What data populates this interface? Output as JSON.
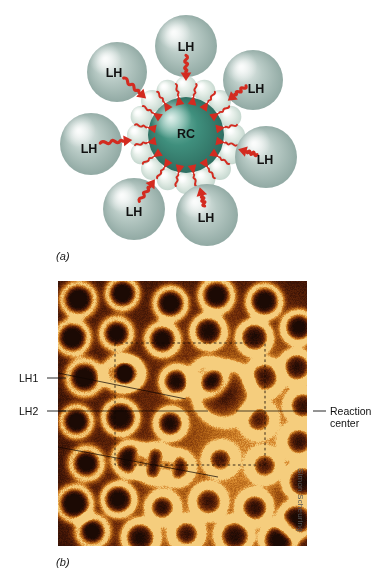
{
  "figure": {
    "panels": [
      {
        "letter": "(a)",
        "type": "schematic"
      },
      {
        "letter": "(b)",
        "type": "afm-micrograph"
      }
    ],
    "credit": "Simon Scheuring"
  },
  "panel_a": {
    "letter": "(a)",
    "core_label": "RC",
    "lh_label": "LH",
    "lh_count": 7,
    "lh_spheres": [
      {
        "label": "LH",
        "cx": 186,
        "cy": 46,
        "r": 31,
        "label_x": 186,
        "label_y": 48
      },
      {
        "label": "LH",
        "cx": 117,
        "cy": 72,
        "r": 30,
        "label_x": 114,
        "label_y": 74
      },
      {
        "label": "LH",
        "cx": 253,
        "cy": 80,
        "r": 30,
        "label_x": 256,
        "label_y": 90
      },
      {
        "label": "LH",
        "cx": 91,
        "cy": 144,
        "r": 31,
        "label_x": 89,
        "label_y": 150
      },
      {
        "label": "LH",
        "cx": 266,
        "cy": 157,
        "r": 31,
        "label_x": 265,
        "label_y": 161
      },
      {
        "label": "LH",
        "cx": 134,
        "cy": 209,
        "r": 31,
        "label_x": 134,
        "label_y": 213
      },
      {
        "label": "LH",
        "cx": 207,
        "cy": 215,
        "r": 31,
        "label_x": 206,
        "label_y": 219
      }
    ],
    "core": {
      "cx": 186,
      "cy": 135,
      "r": 38
    },
    "ring_bead_count": 16,
    "ring_radius": 48,
    "ring_bead_radius": 11,
    "colors": {
      "lh_sphere_light": "#eef3f1",
      "lh_sphere_mid": "#b9cbc6",
      "lh_sphere_dark": "#8ea7a1",
      "core_light": "#7fbfae",
      "core_mid": "#3f8f7d",
      "core_dark": "#2d6b5e",
      "ring_bead_light": "#ffffff",
      "ring_bead_mid": "#e6efe9",
      "ring_bead_dark": "#c3d6cd",
      "arrow_red": "#d32b20",
      "text": "#111111",
      "background": "#ffffff"
    }
  },
  "panel_b": {
    "letter": "(b)",
    "callouts": [
      {
        "name": "LH1",
        "text": "LH1"
      },
      {
        "name": "LH2",
        "text": "LH2"
      },
      {
        "name": "reaction-center",
        "text": "Reaction\ncenter"
      }
    ],
    "credit": "Simon Scheuring",
    "image": {
      "left": 58,
      "top": 281,
      "width": 249,
      "height": 265,
      "dashed_box": {
        "x": 57,
        "y": 62,
        "w": 150,
        "h": 122
      }
    },
    "colors": {
      "afm_dark": "#2b0d05",
      "afm_mid": "#6e2708",
      "afm_bright": "#c8821f",
      "afm_highlight": "#e8bb58",
      "dashed_line": "#1a0a05",
      "leader_line": "#111111",
      "text": "#111111",
      "credit_text": "#555555"
    }
  }
}
